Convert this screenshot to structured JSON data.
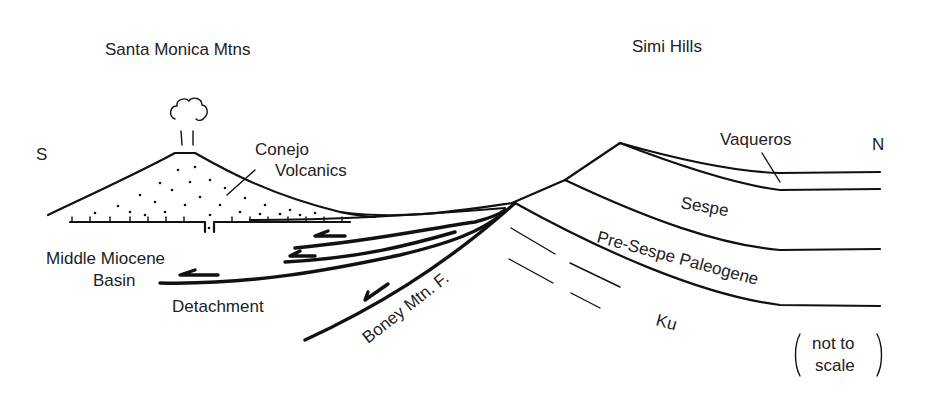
{
  "diagram": {
    "type": "geologic-cross-section",
    "orientation": {
      "left": "S",
      "right": "N"
    },
    "region_labels": {
      "left_range": "Santa Monica Mtns",
      "right_range": "Simi Hills"
    },
    "units": {
      "volcanics_line1": "Conejo",
      "volcanics_line2": "Volcanics",
      "basin_line1": "Middle Miocene",
      "basin_line2": "Basin",
      "detachment": "Detachment",
      "fault": "Boney Mtn. F.",
      "vaqueros": "Vaqueros",
      "sespe": "Sespe",
      "pre_sespe": "Pre-Sespe Paleogene",
      "ku": "Ku"
    },
    "note": {
      "line1": "not to",
      "line2": "scale"
    },
    "colors": {
      "ink": "#111111",
      "text": "#222222",
      "background": "#ffffff"
    }
  }
}
